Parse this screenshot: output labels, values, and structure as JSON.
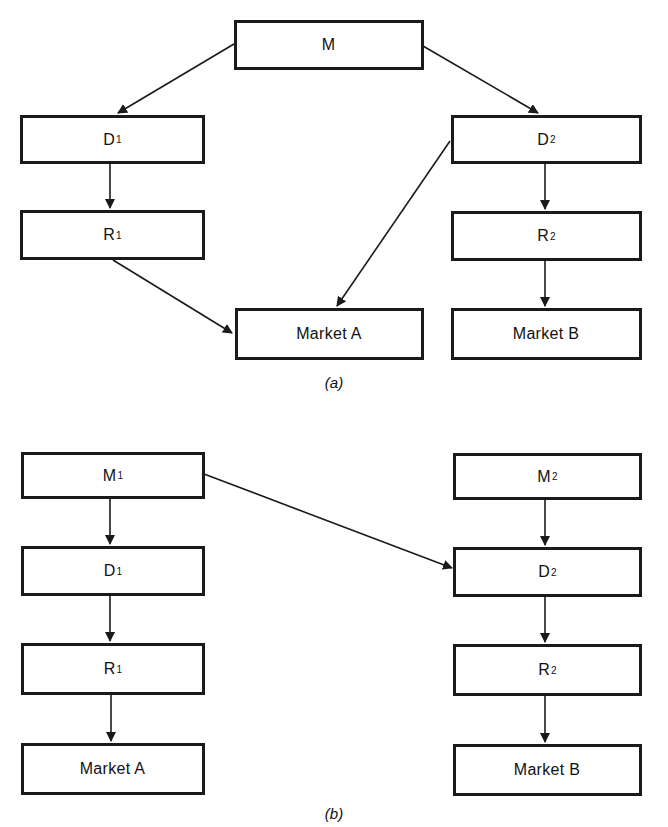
{
  "figure": {
    "panels": [
      {
        "id": "a",
        "caption": "(a)",
        "nodes": [
          {
            "id": "M",
            "label": "M",
            "sub": ""
          },
          {
            "id": "D1",
            "label": "D",
            "sub": "1"
          },
          {
            "id": "R1",
            "label": "R",
            "sub": "1"
          },
          {
            "id": "MarketA",
            "label": "Market A",
            "sub": ""
          },
          {
            "id": "D2",
            "label": "D",
            "sub": "2"
          },
          {
            "id": "R2",
            "label": "R",
            "sub": "2"
          },
          {
            "id": "MarketB",
            "label": "Market B",
            "sub": ""
          }
        ],
        "edges": [
          [
            "M",
            "D1"
          ],
          [
            "M",
            "D2"
          ],
          [
            "D1",
            "R1"
          ],
          [
            "R1",
            "MarketA"
          ],
          [
            "D2",
            "MarketA"
          ],
          [
            "D2",
            "R2"
          ],
          [
            "R2",
            "MarketB"
          ]
        ]
      },
      {
        "id": "b",
        "caption": "(b)",
        "nodes": [
          {
            "id": "M1",
            "label": "M",
            "sub": "1"
          },
          {
            "id": "D1",
            "label": "D",
            "sub": "1"
          },
          {
            "id": "R1",
            "label": "R",
            "sub": "1"
          },
          {
            "id": "MarketA",
            "label": "Market A",
            "sub": ""
          },
          {
            "id": "M2",
            "label": "M",
            "sub": "2"
          },
          {
            "id": "D2",
            "label": "D",
            "sub": "2"
          },
          {
            "id": "R2",
            "label": "R",
            "sub": "2"
          },
          {
            "id": "MarketB",
            "label": "Market B",
            "sub": ""
          }
        ],
        "edges": [
          [
            "M1",
            "D1"
          ],
          [
            "M1",
            "D2"
          ],
          [
            "D1",
            "R1"
          ],
          [
            "R1",
            "MarketA"
          ],
          [
            "M2",
            "D2"
          ],
          [
            "D2",
            "R2"
          ],
          [
            "R2",
            "MarketB"
          ]
        ]
      }
    ]
  },
  "colors": {
    "stroke": "#1a1a1a",
    "background": "#ffffff"
  }
}
